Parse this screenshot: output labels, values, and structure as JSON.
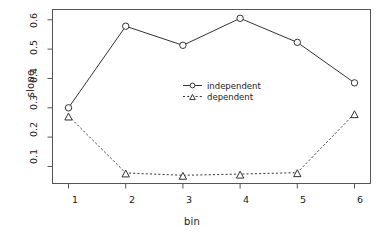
{
  "chart_data": {
    "type": "line",
    "title": "",
    "subtitle": "",
    "xlabel": "bin",
    "ylabel": "slope",
    "x": [
      1,
      2,
      3,
      4,
      5,
      6
    ],
    "categories": [
      "1",
      "2",
      "3",
      "4",
      "5",
      "6"
    ],
    "xtick_labels": [
      "1",
      "2",
      "3",
      "4",
      "5",
      "6"
    ],
    "ytick_labels": [
      "0.1",
      "0.2",
      "0.3",
      "0.4",
      "0.5",
      "0.6"
    ],
    "ytick_values": [
      0.1,
      0.2,
      0.3,
      0.4,
      0.5,
      0.6
    ],
    "xlim": [
      0.72,
      6.28
    ],
    "ylim": [
      0.042,
      0.635
    ],
    "grid": false,
    "legend_position": "center-right",
    "series": [
      {
        "name": "independent",
        "values": [
          0.3,
          0.578,
          0.513,
          0.605,
          0.523,
          0.385
        ],
        "line_style": "solid",
        "marker": "circle",
        "color": "#333333"
      },
      {
        "name": "dependent",
        "values": [
          0.272,
          0.078,
          0.07,
          0.074,
          0.079,
          0.28
        ],
        "line_style": "dashed",
        "marker": "triangle",
        "color": "#333333"
      }
    ]
  },
  "legend": {
    "entries": [
      {
        "label": "independent",
        "marker": "circle",
        "line_style": "solid"
      },
      {
        "label": "dependent",
        "marker": "triangle",
        "line_style": "dashed"
      }
    ]
  },
  "axes": {
    "x": {
      "label": "bin",
      "ticks": [
        "1",
        "2",
        "3",
        "4",
        "5",
        "6"
      ]
    },
    "y": {
      "label": "slope",
      "ticks": [
        "0.1",
        "0.2",
        "0.3",
        "0.4",
        "0.5",
        "0.6"
      ]
    }
  },
  "colors": {
    "foreground": "#333333",
    "text": "#1a1a1a",
    "background": "#ffffff",
    "frame": "#555555"
  }
}
